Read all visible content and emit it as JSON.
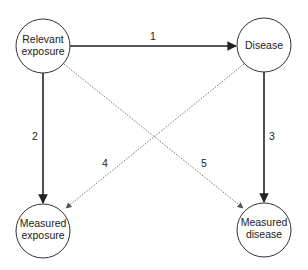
{
  "diagram": {
    "nodes": [
      {
        "id": "relevant_exposure",
        "lines": [
          "Relevant",
          "exposure"
        ]
      },
      {
        "id": "disease",
        "lines": [
          "Disease"
        ]
      },
      {
        "id": "measured_exposure",
        "lines": [
          "Measured",
          "exposure"
        ]
      },
      {
        "id": "measured_disease",
        "lines": [
          "Measured",
          "disease"
        ]
      }
    ],
    "edges": [
      {
        "label": "1",
        "from": "relevant_exposure",
        "to": "disease",
        "style": "solid"
      },
      {
        "label": "2",
        "from": "relevant_exposure",
        "to": "measured_exposure",
        "style": "solid"
      },
      {
        "label": "3",
        "from": "disease",
        "to": "measured_disease",
        "style": "solid"
      },
      {
        "label": "4",
        "from": "disease",
        "to": "measured_exposure",
        "style": "dotted"
      },
      {
        "label": "5",
        "from": "relevant_exposure",
        "to": "measured_disease",
        "style": "dotted"
      }
    ]
  }
}
